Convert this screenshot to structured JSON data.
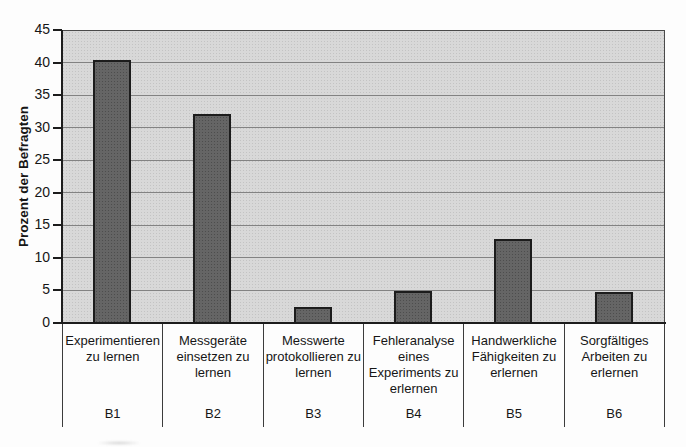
{
  "chart_data": {
    "type": "bar",
    "title": "",
    "ylabel": "Prozent der Befragten",
    "xlabel": "",
    "ylim": [
      0,
      45
    ],
    "ytick_step": 5,
    "yticks": [
      0,
      5,
      10,
      15,
      20,
      25,
      30,
      35,
      40,
      45
    ],
    "grid": true,
    "legend": false,
    "categories": [
      "Experimentieren zu lernen",
      "Messgeräte einsetzen zu lernen",
      "Messwerte protokollieren zu lernen",
      "Fehleranalyse eines Experiments zu erlernen",
      "Handwerkliche Fähigkeiten zu erlernen",
      "Sorgfältiges Arbeiten zu erlernen"
    ],
    "category_line_breaks": [
      [
        "Experimentieren",
        "zu lernen"
      ],
      [
        "Messgeräte",
        "einsetzen zu",
        "lernen"
      ],
      [
        "Messwerte",
        "protokollieren zu",
        "lernen"
      ],
      [
        "Fehleranalyse",
        "eines",
        "Experiments zu",
        "erlernen"
      ],
      [
        "Handwerkliche",
        "Fähigkeiten zu",
        "erlernen"
      ],
      [
        "Sorgfältiges",
        "Arbeiten zu",
        "erlernen"
      ]
    ],
    "category_codes": [
      "B1",
      "B2",
      "B3",
      "B4",
      "B5",
      "B6"
    ],
    "values": [
      40.5,
      32.2,
      2.5,
      5.0,
      13.0,
      4.8
    ],
    "colors": {
      "plot_bg": "#d8d8d8",
      "bar_fill": "#656565",
      "bar_border": "#1c1c1c",
      "gridline": "#828282",
      "axis": "#1c1c1c",
      "text": "#161616"
    }
  }
}
